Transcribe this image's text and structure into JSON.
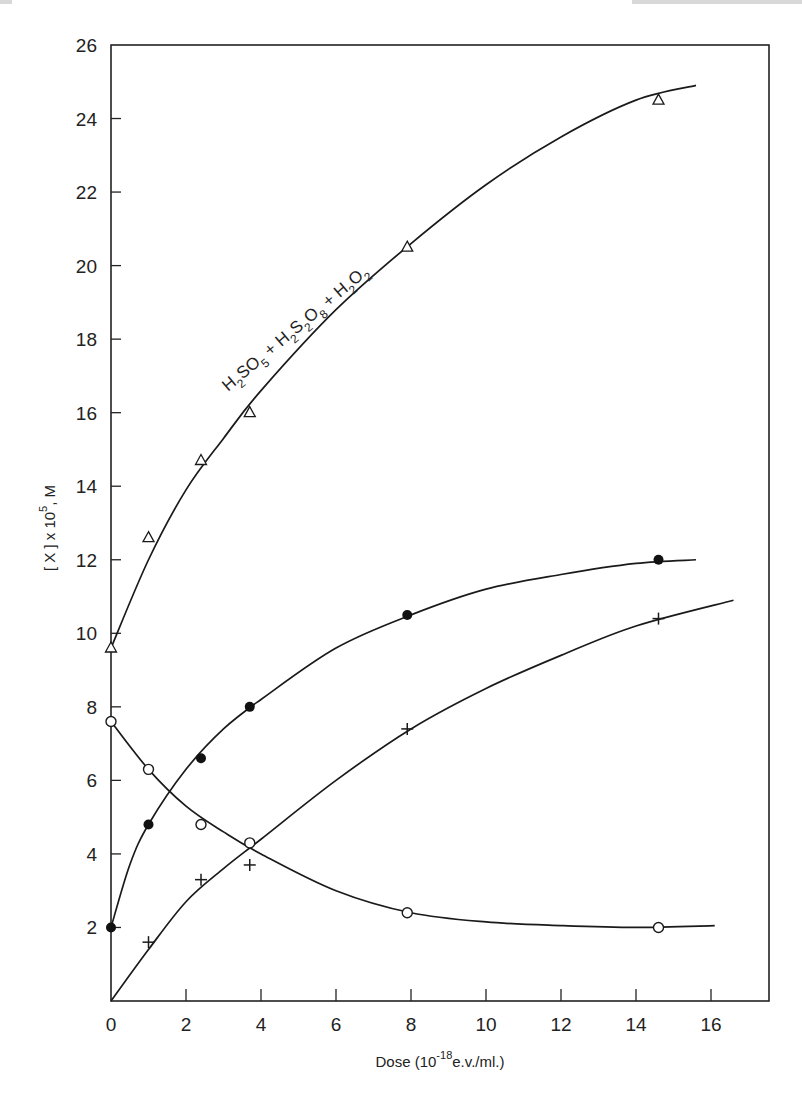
{
  "chart_data": {
    "type": "scatter",
    "title": "",
    "xlabel": "Dose (10^-18 e.v./ml.)",
    "xlabel_parts": {
      "main": "Dose (10",
      "sup": "-18",
      "tail": "e.v./ml.)"
    },
    "ylabel": "[X] x 10^5, M",
    "ylabel_parts": {
      "main": "[ X ] x 10",
      "sup": "5",
      "tail": ", M"
    },
    "xlim": [
      0,
      17.5
    ],
    "ylim": [
      0,
      26
    ],
    "x_ticks": [
      0,
      2,
      4,
      6,
      8,
      10,
      12,
      14,
      16
    ],
    "y_ticks": [
      2,
      4,
      6,
      8,
      10,
      12,
      14,
      16,
      18,
      20,
      22,
      24,
      26
    ],
    "x_tick_labels": [
      "0",
      "2",
      "4",
      "6",
      "8",
      "10",
      "12",
      "14",
      "16"
    ],
    "y_tick_labels": [
      "2",
      "4",
      "6",
      "8",
      "10",
      "12",
      "14",
      "16",
      "18",
      "20",
      "22",
      "24",
      "26"
    ],
    "grid": false,
    "legend": null,
    "annotations": [
      {
        "text": "H2SO5 + H2S2O8 + H2O2",
        "series": "triangle",
        "rotation_deg": -40
      }
    ],
    "series": [
      {
        "name": "H2SO5 + H2S2O8 + H2O2",
        "marker": "open-triangle",
        "x": [
          0,
          1.0,
          2.4,
          3.7,
          7.9,
          14.6
        ],
        "y": [
          9.6,
          12.6,
          14.7,
          16.0,
          20.5,
          24.5
        ],
        "curve_x": [
          0,
          1,
          2,
          3,
          4,
          6,
          8,
          10,
          12,
          14,
          15.6
        ],
        "curve_y": [
          9.6,
          12.0,
          13.9,
          15.3,
          16.6,
          18.8,
          20.6,
          22.2,
          23.5,
          24.5,
          24.9
        ]
      },
      {
        "name": "filled-circle series",
        "marker": "filled-circle",
        "x": [
          0,
          1.0,
          2.4,
          3.7,
          7.9,
          14.6
        ],
        "y": [
          2.0,
          4.8,
          6.6,
          8.0,
          10.5,
          12.0
        ],
        "curve_x": [
          0,
          0.5,
          1,
          2,
          3,
          4,
          6,
          8,
          10,
          12,
          14,
          15.6
        ],
        "curve_y": [
          2.0,
          3.7,
          4.8,
          6.3,
          7.4,
          8.2,
          9.6,
          10.5,
          11.2,
          11.6,
          11.9,
          12.0
        ]
      },
      {
        "name": "plus series",
        "marker": "plus",
        "x": [
          1.0,
          2.4,
          3.7,
          7.9,
          14.6
        ],
        "y": [
          1.6,
          3.3,
          3.7,
          7.4,
          10.4
        ],
        "curve_x": [
          0,
          1,
          2,
          3,
          4,
          6,
          8,
          10,
          12,
          14,
          16.6
        ],
        "curve_y": [
          0,
          1.4,
          2.7,
          3.6,
          4.4,
          6.0,
          7.4,
          8.5,
          9.4,
          10.2,
          10.9
        ]
      },
      {
        "name": "open-circle series",
        "marker": "open-circle",
        "x": [
          0,
          1.0,
          2.4,
          3.7,
          7.9,
          14.6
        ],
        "y": [
          7.6,
          6.3,
          4.8,
          4.3,
          2.4,
          2.0
        ],
        "curve_x": [
          0,
          1,
          2,
          3,
          4,
          6,
          8,
          10,
          12,
          14,
          16.1
        ],
        "curve_y": [
          7.6,
          6.3,
          5.3,
          4.6,
          4.0,
          3.0,
          2.4,
          2.15,
          2.05,
          2.0,
          2.05
        ]
      }
    ]
  }
}
